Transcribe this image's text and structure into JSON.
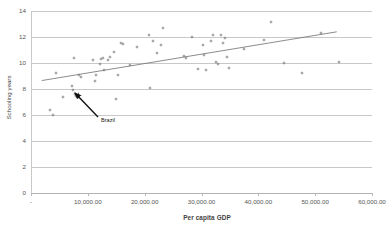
{
  "chart_data": {
    "type": "scatter",
    "title": "",
    "xlabel": "Per capita GDP",
    "ylabel": "Schooling years",
    "xlim": [
      0,
      60000
    ],
    "ylim": [
      0,
      14
    ],
    "grid": true,
    "legend": false,
    "x_ticks": [
      "-",
      "10,000.00",
      "20,000.00",
      "30,000.00",
      "40,000.00",
      "50,000.00",
      "60,000.00"
    ],
    "x_tick_values": [
      0,
      10000,
      20000,
      30000,
      40000,
      50000,
      60000
    ],
    "y_ticks": [
      "0",
      "2",
      "4",
      "6",
      "8",
      "10",
      "12",
      "14"
    ],
    "y_tick_values": [
      0,
      2,
      4,
      6,
      8,
      10,
      12,
      14
    ],
    "series": [
      {
        "name": "Countries",
        "marker": "diamond",
        "color": "#7c7c7c",
        "points": [
          {
            "x": 3300,
            "y": 6.35
          },
          {
            "x": 3900,
            "y": 6.0
          },
          {
            "x": 4400,
            "y": 9.2
          },
          {
            "x": 5700,
            "y": 7.35
          },
          {
            "x": 7200,
            "y": 8.25
          },
          {
            "x": 7400,
            "y": 7.95
          },
          {
            "x": 7500,
            "y": 10.4
          },
          {
            "x": 7700,
            "y": 7.6
          },
          {
            "x": 8000,
            "y": 7.5
          },
          {
            "x": 8500,
            "y": 9.1
          },
          {
            "x": 8800,
            "y": 8.95
          },
          {
            "x": 10900,
            "y": 10.2
          },
          {
            "x": 11200,
            "y": 8.6
          },
          {
            "x": 11400,
            "y": 9.1
          },
          {
            "x": 12100,
            "y": 9.9
          },
          {
            "x": 12400,
            "y": 10.3
          },
          {
            "x": 12600,
            "y": 10.35
          },
          {
            "x": 12900,
            "y": 9.5
          },
          {
            "x": 13500,
            "y": 10.2
          },
          {
            "x": 13900,
            "y": 10.45
          },
          {
            "x": 14600,
            "y": 10.85
          },
          {
            "x": 15000,
            "y": 7.25
          },
          {
            "x": 15300,
            "y": 9.1
          },
          {
            "x": 15800,
            "y": 11.55
          },
          {
            "x": 16100,
            "y": 11.5
          },
          {
            "x": 17500,
            "y": 9.85
          },
          {
            "x": 18700,
            "y": 11.2
          },
          {
            "x": 20800,
            "y": 12.15
          },
          {
            "x": 20900,
            "y": 8.05
          },
          {
            "x": 21500,
            "y": 11.7
          },
          {
            "x": 22100,
            "y": 10.75
          },
          {
            "x": 22800,
            "y": 11.4
          },
          {
            "x": 23300,
            "y": 12.7
          },
          {
            "x": 26900,
            "y": 10.55
          },
          {
            "x": 27300,
            "y": 10.4
          },
          {
            "x": 28300,
            "y": 12.0
          },
          {
            "x": 29300,
            "y": 9.55
          },
          {
            "x": 30200,
            "y": 11.4
          },
          {
            "x": 30500,
            "y": 10.6
          },
          {
            "x": 30800,
            "y": 9.5
          },
          {
            "x": 31700,
            "y": 11.7
          },
          {
            "x": 32100,
            "y": 12.15
          },
          {
            "x": 32600,
            "y": 10.05
          },
          {
            "x": 32900,
            "y": 9.95
          },
          {
            "x": 33400,
            "y": 12.15
          },
          {
            "x": 33800,
            "y": 11.55
          },
          {
            "x": 34200,
            "y": 11.9
          },
          {
            "x": 34400,
            "y": 10.45
          },
          {
            "x": 34900,
            "y": 9.6
          },
          {
            "x": 37400,
            "y": 11.1
          },
          {
            "x": 41000,
            "y": 11.75
          },
          {
            "x": 42200,
            "y": 13.15
          },
          {
            "x": 44600,
            "y": 10.0
          },
          {
            "x": 47700,
            "y": 9.2
          },
          {
            "x": 51100,
            "y": 12.3
          },
          {
            "x": 54200,
            "y": 10.1
          }
        ]
      },
      {
        "name": "Brazil",
        "marker": "diamond-large",
        "color": "#5a5a5a",
        "points": [
          {
            "x": 8300,
            "y": 7.5
          }
        ]
      }
    ],
    "trendline": {
      "type": "linear",
      "x_start": 1900,
      "y_start": 8.65,
      "x_end": 53800,
      "y_end": 12.4,
      "color": "#6f6f6f"
    },
    "annotations": [
      {
        "label": "Brazil",
        "label_x": 101,
        "label_y": 120,
        "arrow_from_x": 98,
        "arrow_from_y": 117,
        "arrow_to_x": 75,
        "arrow_to_y": 93
      }
    ]
  }
}
